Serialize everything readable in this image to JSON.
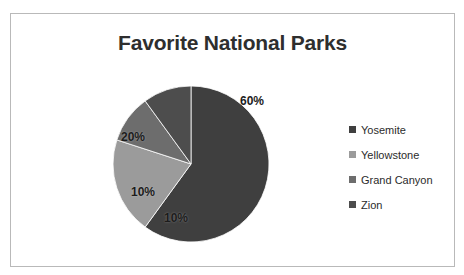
{
  "chart_data": {
    "type": "pie",
    "title": "Favorite National Parks",
    "categories": [
      "Yosemite",
      "Yellowstone",
      "Grand Canyon",
      "Zion"
    ],
    "values": [
      60,
      20,
      10,
      10
    ],
    "data_labels": [
      "60%",
      "20%",
      "10%",
      "10%"
    ],
    "unit": "percent",
    "legend_position": "right",
    "grid": false,
    "colors": [
      "#3f3f3f",
      "#9b9b9b",
      "#6d6d6d",
      "#4d4d4d"
    ],
    "slices": [
      {
        "label": "Yosemite",
        "value": 60,
        "data_label": "60%",
        "color": "#3f3f3f",
        "start_angle": 0,
        "end_angle": 216,
        "label_x": 61,
        "label_y": 63
      },
      {
        "label": "Yellowstone",
        "value": 20,
        "data_label": "20%",
        "color": "#9b9b9b",
        "start_angle": 216,
        "end_angle": 288,
        "label_x": -58,
        "label_y": 27
      },
      {
        "label": "Grand Canyon",
        "value": 10,
        "data_label": "10%",
        "color": "#6d6d6d",
        "start_angle": 288,
        "end_angle": 324,
        "label_x": -48,
        "label_y": -28
      },
      {
        "label": "Zion",
        "value": 10,
        "data_label": "10%",
        "color": "#4d4d4d",
        "start_angle": 324,
        "end_angle": 360,
        "label_x": -15,
        "label_y": -54
      }
    ]
  },
  "chart": {
    "title": "Favorite National Parks",
    "geometry": {
      "center_x": 88,
      "center_y": 88,
      "radius": 78
    }
  },
  "legend": {
    "items": [
      {
        "label": "Yosemite",
        "color": "#3f3f3f"
      },
      {
        "label": "Yellowstone",
        "color": "#9b9b9b"
      },
      {
        "label": "Grand Canyon",
        "color": "#6d6d6d"
      },
      {
        "label": "Zion",
        "color": "#4d4d4d"
      }
    ]
  }
}
